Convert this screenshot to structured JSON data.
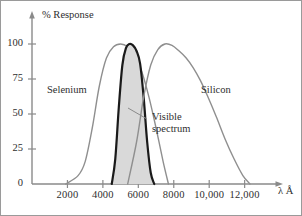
{
  "chart_data": {
    "type": "line",
    "title": "",
    "xlabel": "λ Å",
    "ylabel": "% Response",
    "xlim": [
      0,
      13600
    ],
    "ylim": [
      0,
      112
    ],
    "grid": false,
    "legend_position": "inline-annotations",
    "xticks": [
      2000,
      4000,
      6000,
      8000,
      10000,
      12000
    ],
    "xtick_labels": [
      "2000",
      "4000",
      "6000",
      "8000",
      "10,000",
      "12,000"
    ],
    "yticks": [
      0,
      25,
      50,
      75,
      100
    ],
    "ytick_labels": [
      "0",
      "25",
      "50",
      "75",
      "100"
    ],
    "annotations": [
      {
        "text": "Selenium",
        "x": 2600,
        "y": 68
      },
      {
        "text": "Silicon",
        "x": 9700,
        "y": 68
      },
      {
        "text": "Visible spectrum",
        "x": 7150,
        "y": 39
      }
    ],
    "series": [
      {
        "name": "Selenium",
        "color": "#8f8f8f",
        "line_width": 1.4,
        "fill": false,
        "x": [
          1900,
          2600,
          3000,
          3400,
          3800,
          4200,
          4600,
          5000,
          5400,
          5800,
          6200,
          6600,
          7000,
          7400,
          7700
        ],
        "values": [
          0,
          6,
          16,
          40,
          70,
          90,
          98,
          100,
          98,
          92,
          80,
          62,
          40,
          16,
          0
        ]
      },
      {
        "name": "Visible spectrum",
        "color": "#1a1a1a",
        "line_width": 2.2,
        "fill": true,
        "fill_color": "#d9d9d9",
        "x": [
          4500,
          4700,
          4900,
          5100,
          5300,
          5500,
          5700,
          5900,
          6100,
          6300,
          6500,
          6700,
          6900
        ],
        "values": [
          0,
          18,
          55,
          85,
          97,
          100,
          99,
          95,
          86,
          62,
          30,
          8,
          0
        ]
      },
      {
        "name": "Silicon",
        "color": "#8f8f8f",
        "line_width": 1.4,
        "fill": false,
        "x": [
          5400,
          5900,
          6300,
          6700,
          7100,
          7500,
          7900,
          8300,
          8700,
          9100,
          9500,
          9900,
          10400,
          10900,
          11400,
          11900,
          12300
        ],
        "values": [
          0,
          30,
          62,
          85,
          96,
          100,
          99,
          95,
          90,
          83,
          74,
          63,
          48,
          32,
          18,
          6,
          0
        ]
      }
    ]
  },
  "axes": {
    "y_axis_title": "% Response",
    "x_axis_title": "λ Å"
  },
  "labels": {
    "selenium": "Selenium",
    "silicon": "Silicon",
    "visible_line1": "Visible",
    "visible_line2": "spectrum"
  },
  "colors": {
    "curve_gray": "#8f8f8f",
    "curve_black": "#1a1a1a",
    "fill_gray": "#d9d9d9",
    "axis": "#8a8a8a",
    "text": "#2e2e2e",
    "frame": "#9a9a9a"
  }
}
